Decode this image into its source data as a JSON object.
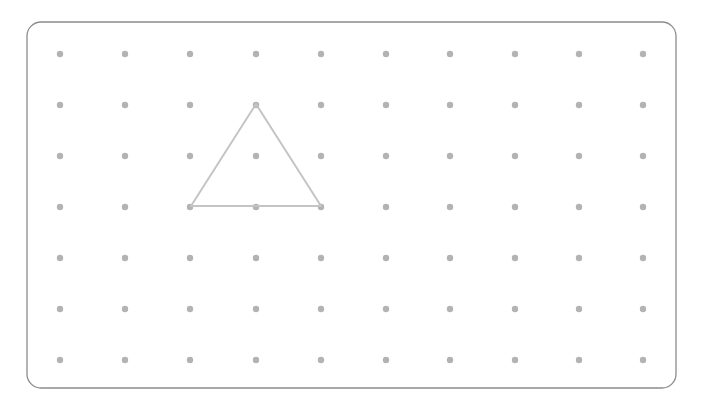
{
  "geoboard": {
    "frame": {
      "x": 27,
      "y": 22,
      "width": 649,
      "height": 366,
      "radius": 14,
      "stroke": "#8c8c8c"
    },
    "grid": {
      "columns": [
        60,
        125,
        190,
        256,
        321,
        386,
        450,
        515,
        579,
        643
      ],
      "rows": [
        54,
        105,
        156,
        207,
        258,
        309,
        360
      ],
      "dot_radius": 3.2,
      "dot_color": "#b3b3b3"
    },
    "shapes": [
      {
        "type": "triangle",
        "points": [
          [
            256,
            104
          ],
          [
            191,
            206
          ],
          [
            321,
            206
          ]
        ],
        "stroke": "#c4c4c4",
        "stroke_width": 2
      }
    ]
  }
}
